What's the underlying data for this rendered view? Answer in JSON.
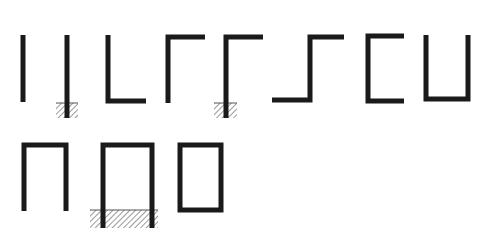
{
  "diagram": {
    "title": "",
    "stroke_color": "#1a1a1a",
    "hatch_color": "#555555",
    "background": "#ffffff",
    "stroke_width": 5,
    "shapes": [
      {
        "id": "vertical-bar",
        "kind": "polyline",
        "points": [
          [
            23,
            35
          ],
          [
            23,
            102
          ]
        ],
        "footing": null
      },
      {
        "id": "vertical-bar-fixed",
        "kind": "polyline",
        "points": [
          [
            67,
            35
          ],
          [
            67,
            118
          ]
        ],
        "footing": {
          "x": 56,
          "y": 103,
          "w": 22,
          "h": 15
        }
      },
      {
        "id": "l-frame",
        "kind": "polyline",
        "points": [
          [
            108,
            35
          ],
          [
            108,
            101
          ],
          [
            146,
            101
          ]
        ],
        "footing": null
      },
      {
        "id": "gamma-frame",
        "kind": "polyline",
        "points": [
          [
            168,
            103
          ],
          [
            168,
            37
          ],
          [
            205,
            37
          ]
        ],
        "footing": null
      },
      {
        "id": "gamma-frame-fixed",
        "kind": "polyline",
        "points": [
          [
            226,
            118
          ],
          [
            226,
            37
          ],
          [
            263,
            37
          ]
        ],
        "footing": {
          "x": 214,
          "y": 103,
          "w": 23,
          "h": 15
        }
      },
      {
        "id": "step-frame",
        "kind": "polyline",
        "points": [
          [
            272,
            100
          ],
          [
            310,
            100
          ],
          [
            310,
            37
          ],
          [
            344,
            37
          ]
        ],
        "footing": null
      },
      {
        "id": "c-frame",
        "kind": "polyline",
        "points": [
          [
            404,
            36
          ],
          [
            368,
            36
          ],
          [
            368,
            101
          ],
          [
            404,
            101
          ]
        ],
        "footing": null
      },
      {
        "id": "u-frame",
        "kind": "polyline",
        "points": [
          [
            426,
            35
          ],
          [
            426,
            99
          ],
          [
            468,
            99
          ],
          [
            468,
            35
          ]
        ],
        "footing": null
      },
      {
        "id": "portal-frame",
        "kind": "polyline",
        "points": [
          [
            24,
            211
          ],
          [
            24,
            145
          ],
          [
            66,
            145
          ],
          [
            66,
            211
          ]
        ],
        "footing": null
      },
      {
        "id": "portal-frame-fixed",
        "kind": "polyline",
        "points": [
          [
            103,
            228
          ],
          [
            103,
            145
          ],
          [
            152,
            145
          ],
          [
            152,
            228
          ]
        ],
        "footing": {
          "x": 90,
          "y": 210,
          "w": 68,
          "h": 18
        }
      },
      {
        "id": "closed-frame",
        "kind": "rect",
        "x": 180,
        "y": 145,
        "w": 41,
        "h": 65,
        "footing": null
      }
    ]
  }
}
